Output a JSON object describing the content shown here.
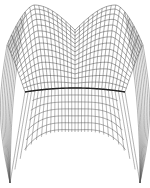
{
  "figure": {
    "type": "wireframe-surface",
    "background": "#ffffff",
    "line_color": "#555555",
    "ridge_color": "#222222",
    "grid": {
      "columns": 30,
      "rows": 14
    },
    "peaks": [
      {
        "x": 30,
        "y": 5
      },
      {
        "x": 120,
        "y": 5
      }
    ],
    "top_dip": {
      "x": 75,
      "y": 30
    },
    "ridge_y": 88,
    "front_edge_bottom_y": 132,
    "leg_tips": [
      {
        "x": 10,
        "y": 183
      },
      {
        "x": 140,
        "y": 183
      }
    ]
  }
}
